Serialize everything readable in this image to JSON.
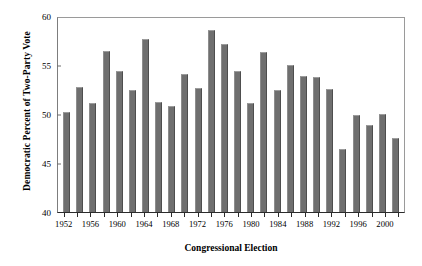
{
  "chart_data": {
    "type": "bar",
    "title": "",
    "xlabel": "Congressional Election",
    "ylabel": "Democratic Percent of Two-Party Vote",
    "ylim": [
      40,
      60
    ],
    "yticks": [
      40,
      45,
      50,
      55,
      60
    ],
    "ytick_labels": [
      "40",
      "45",
      "50",
      "55",
      "60"
    ],
    "grid": false,
    "legend": null,
    "xtick_labels": [
      "1952",
      "1956",
      "1960",
      "1964",
      "1968",
      "1972",
      "1976",
      "1980",
      "1984",
      "1988",
      "1992",
      "1996",
      "2000"
    ],
    "xtick_step": 2,
    "categories": [
      "1952",
      "1954",
      "1956",
      "1958",
      "1960",
      "1962",
      "1964",
      "1966",
      "1968",
      "1970",
      "1972",
      "1974",
      "1976",
      "1978",
      "1980",
      "1982",
      "1984",
      "1986",
      "1988",
      "1990",
      "1992",
      "1994",
      "1996",
      "1998",
      "2000",
      "2002"
    ],
    "values": [
      50.2,
      52.8,
      51.1,
      56.4,
      54.4,
      52.4,
      57.7,
      51.2,
      50.8,
      54.1,
      52.7,
      58.6,
      57.1,
      54.4,
      51.1,
      56.3,
      52.5,
      55.0,
      53.9,
      53.8,
      52.6,
      46.4,
      49.9,
      48.9,
      50.0,
      47.6
    ],
    "bar_color": "#6f6f6f",
    "axis_color": "#2b2b2b",
    "background": "#ffffff"
  }
}
